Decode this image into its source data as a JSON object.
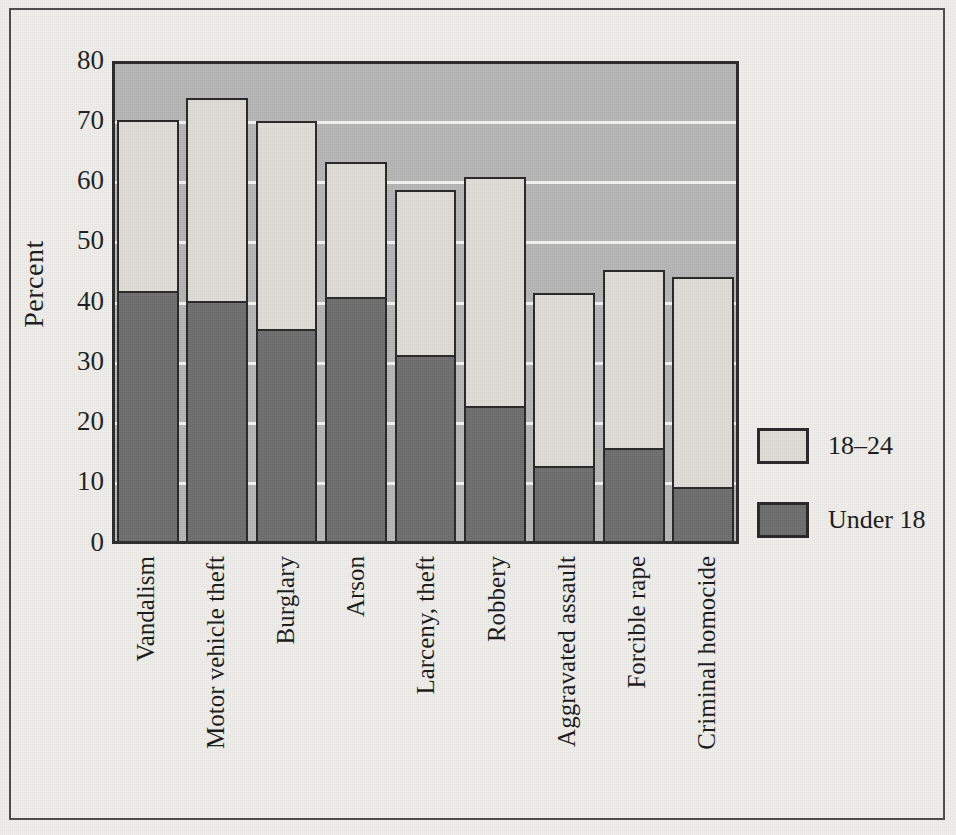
{
  "chart_data": {
    "type": "bar",
    "title": "",
    "subtitle": "",
    "xlabel": "",
    "ylabel": "Percent",
    "ylim": [
      0,
      80
    ],
    "ytick_labels": [
      "80",
      "70",
      "60",
      "50",
      "40",
      "30",
      "20",
      "10",
      "0"
    ],
    "ytick_values": [
      80,
      70,
      60,
      50,
      40,
      30,
      20,
      10,
      0
    ],
    "grid": true,
    "grid_axis": "y",
    "stacked": true,
    "legend_position": "right",
    "categories": [
      "Vandalism",
      "Motor vehicle theft",
      "Burglary",
      "Arson",
      "Larceny, theft",
      "Robbery",
      "Aggravated assault",
      "Forcible rape",
      "Criminal homocide"
    ],
    "series": [
      {
        "name": "Under 18",
        "color": "#6e6e6e",
        "values": [
          41.6,
          40.0,
          35.2,
          40.7,
          31.0,
          22.5,
          12.5,
          15.5,
          9.0
        ]
      },
      {
        "name": "18–24",
        "color": "#dedcd7",
        "values": [
          28.2,
          33.4,
          34.4,
          22.0,
          27.2,
          37.8,
          28.5,
          29.4,
          34.7
        ]
      }
    ],
    "totals": [
      69.8,
      73.4,
      69.6,
      62.7,
      58.2,
      60.3,
      41.0,
      44.9,
      43.7
    ],
    "legend": [
      {
        "label": "18–24",
        "swatch": "light"
      },
      {
        "label": "Under 18",
        "swatch": "dark"
      }
    ],
    "colors": {
      "plot_background": "#b6b6b6",
      "figure_background": "#efeeeb",
      "gridline": "#f3f3f1",
      "bar_outline": "#272727",
      "upper_segment": "#dedcd7",
      "lower_segment": "#6e6e6e",
      "frame": "#4b4b4b"
    }
  }
}
